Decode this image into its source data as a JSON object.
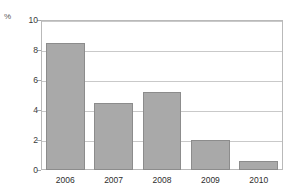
{
  "chart_data": {
    "type": "bar",
    "title": "",
    "subtitle": "",
    "xlabel": "",
    "ylabel": "%",
    "unit_label": "%",
    "categories": [
      "2006",
      "2007",
      "2008",
      "2009",
      "2010"
    ],
    "values": [
      8.5,
      4.5,
      5.2,
      2.0,
      0.6
    ],
    "series": [
      {
        "name": "",
        "values": [
          8.5,
          4.5,
          5.2,
          2.0,
          0.6
        ]
      }
    ],
    "ylim": [
      0,
      10
    ],
    "yticks": [
      0,
      2,
      4,
      6,
      8,
      10
    ],
    "ytick_labels": [
      "0",
      "2",
      "4",
      "6",
      "8",
      "10"
    ],
    "grid": true,
    "grid_axis": "y",
    "legend": false,
    "legend_position": "none",
    "bar_color": "#a9a9a9",
    "bar_border_color": "#8c8c8c",
    "grid_color": "#c9c9c9",
    "frame_color": "#b9b9b9",
    "background": "#ffffff",
    "text_color": "#2e2e2e"
  }
}
